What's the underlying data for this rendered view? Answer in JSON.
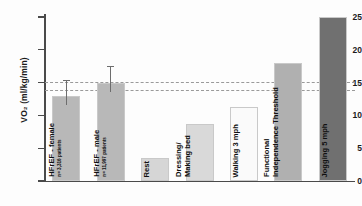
{
  "chart_data": {
    "type": "bar",
    "title": "",
    "xlabel": "",
    "ylabel": "VO₂ (ml/kg/min)",
    "ylim": [
      0,
      25
    ],
    "yticks": [
      0,
      5,
      10,
      15,
      20,
      25
    ],
    "ytick_labels": [
      "0",
      "5",
      "10",
      "15",
      "20",
      "25"
    ],
    "grid": false,
    "legend": "none",
    "categories": [
      "HFrEF - female",
      "HFrEF - male",
      "Rest",
      "Dressing/ Making bed",
      "Walking 3 mph",
      "Functional Independence Threshold",
      "Jogging 5 mph"
    ],
    "values": [
      13.0,
      15.0,
      3.5,
      8.7,
      11.3,
      18.0,
      25.0
    ],
    "error_bars": [
      {
        "category": "HFrEF - female",
        "lower": 11.6,
        "upper": 15.4
      },
      {
        "category": "HFrEF - male",
        "lower": 13.5,
        "upper": 17.5
      }
    ],
    "reference_lines": [
      {
        "value": 15.1,
        "style": "dashed"
      },
      {
        "value": 13.8,
        "style": "dashed"
      }
    ],
    "bar_colors": [
      "#b8b8b8",
      "#b8b8b8",
      "#d6d6d6",
      "#d9d9d9",
      "#fafafa",
      "#b0b0b0",
      "#707070"
    ]
  },
  "bars": [
    {
      "name": "hfref-female",
      "label": "HFrEF - female",
      "sublabel": "n= 3,316 patients",
      "value": 13.0,
      "color": "#b8b8b8",
      "err_low": 11.6,
      "err_high": 15.4
    },
    {
      "name": "hfref-male",
      "label": "HFrEF - male",
      "sublabel": "n= 11,997 patients",
      "value": 15.0,
      "color": "#b8b8b8",
      "err_low": 13.5,
      "err_high": 17.5
    },
    {
      "name": "rest",
      "label": "Rest",
      "sublabel": "",
      "value": 3.5,
      "color": "#d6d6d6",
      "err_low": null,
      "err_high": null
    },
    {
      "name": "dressing-making-bed",
      "label": "Dressing/",
      "label2": "Making bed",
      "sublabel": "",
      "value": 8.7,
      "color": "#d9d9d9",
      "err_low": null,
      "err_high": null
    },
    {
      "name": "walking-3-mph",
      "label": "Walking 3 mph",
      "sublabel": "",
      "value": 11.3,
      "color": "#fafafa",
      "err_low": null,
      "err_high": null
    },
    {
      "name": "functional-independence-threshold",
      "label": "Functional",
      "label2": "Independence Threshold",
      "sublabel": "",
      "value": 18.0,
      "color": "#b0b0b0",
      "err_low": null,
      "err_high": null
    },
    {
      "name": "jogging-5-mph",
      "label": "Jogging 5 mph",
      "sublabel": "",
      "value": 25.0,
      "color": "#707070",
      "err_low": null,
      "err_high": null
    }
  ]
}
